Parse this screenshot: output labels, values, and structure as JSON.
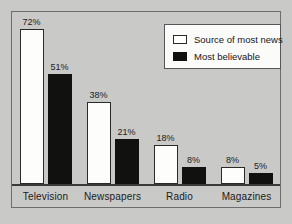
{
  "chart_data": {
    "type": "bar",
    "title": "",
    "subtitle": "",
    "xlabel": "",
    "ylabel": "",
    "ylim": [
      0,
      80
    ],
    "grid": false,
    "legend_position": "top-right",
    "categories": [
      "Television",
      "Newspapers",
      "Radio",
      "Magazines"
    ],
    "series": [
      {
        "name": "Source of most news",
        "color": "#ffffff",
        "values": [
          72,
          38,
          18,
          8
        ],
        "labels": [
          "72%",
          "38%",
          "18%",
          "8%"
        ]
      },
      {
        "name": "Most believable",
        "color": "#111110",
        "values": [
          51,
          21,
          8,
          5
        ],
        "labels": [
          "51%",
          "21%",
          "8%",
          "5%"
        ]
      }
    ]
  },
  "legend": {
    "entries": [
      {
        "label": "Source of most news",
        "swatch": "white-outlined-swatch"
      },
      {
        "label": "Most believable",
        "swatch": "black-filled-swatch"
      }
    ]
  },
  "colors": {
    "background": "#c9c9c7",
    "frame_border": "#6d6d6b",
    "axis_line": "#3a3a38",
    "bar_outline": "#2a2a28",
    "bar_fill_series_0": "#fdfdfb",
    "bar_fill_series_1": "#111110",
    "legend_background": "#fbfbf9",
    "legend_border": "#55555a",
    "text": "#1b1b1b"
  }
}
